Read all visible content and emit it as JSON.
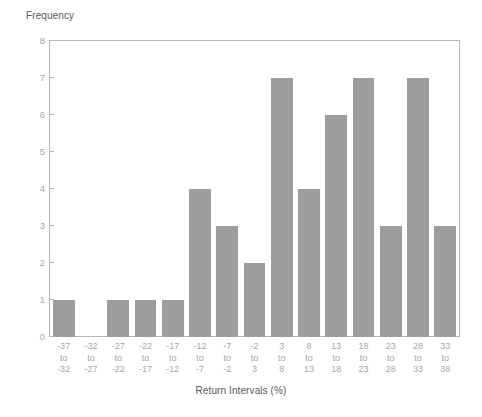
{
  "chart_data": {
    "type": "bar",
    "title": "",
    "subtitle": "",
    "xlabel": "Return Intervals (%)",
    "ylabel": "Frequency",
    "categories": [
      "-37 to -32",
      "-32 to -27",
      "-27 to -22",
      "-22 to -17",
      "-17 to -12",
      "-12 to -7",
      "-7 to -2",
      "-2 to 3",
      "3 to 8",
      "8 to 13",
      "13 to 18",
      "18 to 23",
      "23 to 28",
      "28 to 33",
      "33 to 38"
    ],
    "category_lines": [
      [
        "-37",
        "to",
        "-32"
      ],
      [
        "-32",
        "to",
        "-27"
      ],
      [
        "-27",
        "to",
        "-22"
      ],
      [
        "-22",
        "to",
        "-17"
      ],
      [
        "-17",
        "to",
        "-12"
      ],
      [
        "-12",
        "to",
        "-7"
      ],
      [
        "-7",
        "to",
        "-2"
      ],
      [
        "-2",
        "to",
        "3"
      ],
      [
        "3",
        "to",
        "8"
      ],
      [
        "8",
        "to",
        "13"
      ],
      [
        "13",
        "to",
        "18"
      ],
      [
        "18",
        "to",
        "23"
      ],
      [
        "23",
        "to",
        "28"
      ],
      [
        "28",
        "to",
        "33"
      ],
      [
        "33",
        "to",
        "38"
      ]
    ],
    "values": [
      1,
      0,
      1,
      1,
      1,
      4,
      3,
      2,
      7,
      4,
      6,
      7,
      3,
      7,
      3
    ],
    "ylim": [
      0,
      8
    ],
    "yticks": [
      0,
      1,
      2,
      3,
      4,
      5,
      6,
      7,
      8
    ],
    "ytick_labels": [
      "0",
      "1",
      "2",
      "3",
      "4",
      "5",
      "6",
      "7",
      "8"
    ],
    "grid": false,
    "legend": null,
    "bar_color": "#9d9d9d",
    "axis_color": "#b6b6b6",
    "tick_label_color": "#a6a6a6",
    "axis_title_color": "#595959",
    "background_color": "#ffffff"
  }
}
